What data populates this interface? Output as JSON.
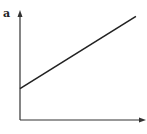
{
  "panel_label": "a",
  "chart_data": {
    "type": "line",
    "title": "",
    "xlabel": "",
    "ylabel": "",
    "xlim": [
      0,
      1
    ],
    "ylim": [
      0,
      1
    ],
    "grid": false,
    "legend": "none",
    "series": [
      {
        "name": "line",
        "x": [
          0,
          0.92
        ],
        "y": [
          0.29,
          0.96
        ]
      }
    ],
    "colors": {
      "line": "#222222",
      "axis": "#333333"
    }
  }
}
